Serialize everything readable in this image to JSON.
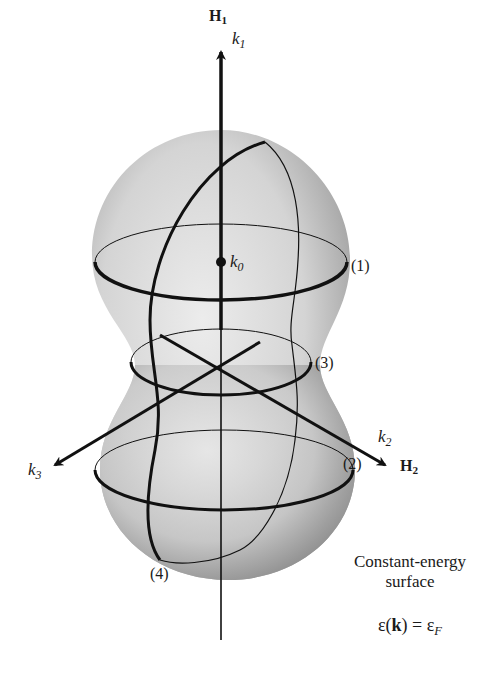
{
  "figure": {
    "axes": {
      "vertical": {
        "upper_label": "H",
        "upper_sub": "1",
        "k_label": "k",
        "k_sub": "1"
      },
      "right": {
        "k_label": "k",
        "k_sub": "2",
        "h_label": "H",
        "h_sub": "2"
      },
      "left": {
        "k_label": "k",
        "k_sub": "3"
      }
    },
    "center_point": {
      "label": "k",
      "sub": "0"
    },
    "orbit_labels": [
      "(1)",
      "(2)",
      "(3)",
      "(4)"
    ],
    "caption": {
      "line1": "Constant-energy",
      "line2": "surface"
    },
    "equation": {
      "lhs_symbol": "ε",
      "k": "k",
      "equals": " = ",
      "rhs_symbol": "ε",
      "rhs_sub": "F"
    },
    "colors": {
      "surface_light": "#e6e6e6",
      "surface_dark": "#8a8a8a",
      "lines": "#111111"
    }
  }
}
